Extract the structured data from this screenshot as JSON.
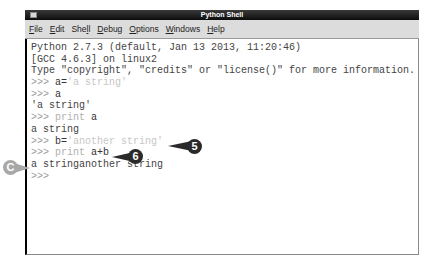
{
  "window": {
    "title": "Python Shell"
  },
  "menubar": {
    "items": [
      {
        "label": "File",
        "mnemonic": "F",
        "rest": "ile"
      },
      {
        "label": "Edit",
        "mnemonic": "E",
        "rest": "dit"
      },
      {
        "label": "Shell",
        "pre": "She",
        "mnemonic": "l",
        "rest": "l"
      },
      {
        "label": "Debug",
        "mnemonic": "D",
        "rest": "ebug"
      },
      {
        "label": "Options",
        "mnemonic": "O",
        "rest": "ptions"
      },
      {
        "label": "Windows",
        "mnemonic": "W",
        "rest": "indows"
      },
      {
        "label": "Help",
        "mnemonic": "H",
        "rest": "elp"
      }
    ]
  },
  "shell": {
    "lines": [
      {
        "type": "out",
        "text": "Python 2.7.3 (default, Jan 13 2013, 11:20:46)"
      },
      {
        "type": "out",
        "text": "[GCC 4.6.3] on linux2"
      },
      {
        "type": "out",
        "text": "Type \"copyright\", \"credits\" or \"license()\" for more information."
      },
      {
        "type": "input",
        "prompt": ">>> ",
        "kw": "",
        "code": "a=",
        "str": "'a string'"
      },
      {
        "type": "input",
        "prompt": ">>> ",
        "kw": "",
        "code": "a",
        "str": ""
      },
      {
        "type": "out",
        "text": "'a string'"
      },
      {
        "type": "input",
        "prompt": ">>> ",
        "kw": "print ",
        "code": "a",
        "str": ""
      },
      {
        "type": "out",
        "text": "a string"
      },
      {
        "type": "input",
        "prompt": ">>> ",
        "kw": "",
        "code": "b=",
        "str": "'another string'"
      },
      {
        "type": "input",
        "prompt": ">>> ",
        "kw": "print ",
        "code": "a+b",
        "str": ""
      },
      {
        "type": "out",
        "text": "a stringanother string"
      },
      {
        "type": "input",
        "prompt": ">>>",
        "kw": "",
        "code": "",
        "str": ""
      }
    ]
  },
  "callouts": [
    {
      "label": "5",
      "style": "dark"
    },
    {
      "label": "6",
      "style": "dark"
    },
    {
      "label": "C",
      "style": "grey"
    }
  ],
  "colors": {
    "titlebar": "#0c0c0c",
    "menubar": "#dcdcdc",
    "callout_dark": "#2a2a2a",
    "callout_grey": "#a8a8a8"
  }
}
